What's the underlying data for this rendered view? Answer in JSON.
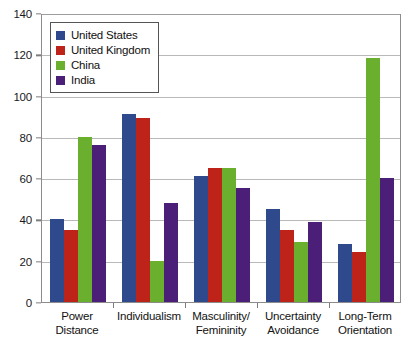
{
  "chart_data": {
    "type": "bar",
    "title": "",
    "xlabel": "",
    "ylabel": "",
    "ylim": [
      0,
      140
    ],
    "ytick_step": 20,
    "yticks": [
      0,
      20,
      40,
      60,
      80,
      100,
      120,
      140
    ],
    "grid": true,
    "legend_position": "top-left",
    "categories": [
      "Power Distance",
      "Individualism",
      "Masculinity/Femininity",
      "Uncertainty Avoidance",
      "Long-Term Orientation"
    ],
    "category_lines": [
      [
        "Power",
        "Distance"
      ],
      [
        "Individualism"
      ],
      [
        "Masculinity/",
        "Femininity"
      ],
      [
        "Uncertainty",
        "Avoidance"
      ],
      [
        "Long-Term",
        "Orientation"
      ]
    ],
    "series": [
      {
        "name": "United States",
        "color": "#2e4a8c",
        "values": [
          40,
          91,
          61,
          45,
          28
        ]
      },
      {
        "name": "United Kingdom",
        "color": "#bd2318",
        "values": [
          35,
          89,
          65,
          35,
          24
        ]
      },
      {
        "name": "China",
        "color": "#6aaf2e",
        "values": [
          80,
          20,
          65,
          29,
          118
        ]
      },
      {
        "name": "India",
        "color": "#4b1f78",
        "values": [
          76,
          48,
          55,
          39,
          60
        ]
      }
    ]
  }
}
